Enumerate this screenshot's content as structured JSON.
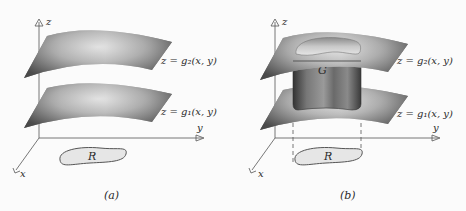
{
  "figure": {
    "panels": [
      {
        "id": "a",
        "caption": "(a)",
        "axes": {
          "z": "z",
          "y": "y",
          "x": "x"
        },
        "surfaces": [
          {
            "label": "z = g₂(x, y)",
            "role": "upper"
          },
          {
            "label": "z = g₁(x, y)",
            "role": "lower"
          }
        ],
        "region": "R"
      },
      {
        "id": "b",
        "caption": "(b)",
        "axes": {
          "z": "z",
          "y": "y",
          "x": "x"
        },
        "surfaces": [
          {
            "label": "z = g₂(x, y)",
            "role": "upper"
          },
          {
            "label": "z = g₁(x, y)",
            "role": "lower"
          }
        ],
        "solid": "G",
        "region": "R"
      }
    ]
  }
}
